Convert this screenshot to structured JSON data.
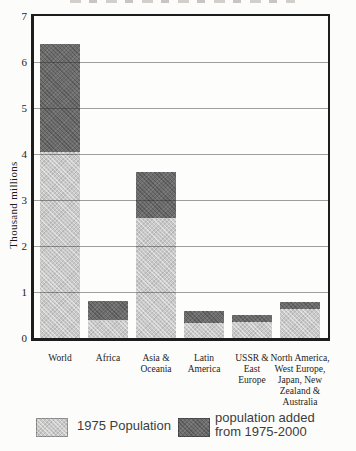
{
  "chart_data": {
    "type": "bar",
    "stacked": true,
    "ylabel": "Thousand millions",
    "ylim": [
      0,
      7
    ],
    "yticks": [
      0,
      1,
      2,
      3,
      4,
      5,
      6,
      7
    ],
    "grid": true,
    "legend_position": "bottom",
    "categories": [
      "World",
      "Africa",
      "Asia &\nOceania",
      "Latin\nAmerica",
      "USSR &\nEast\nEurope",
      "North America,\nWest Europe,\nJapan, New\nZealand &\nAustralia"
    ],
    "series": [
      {
        "name": "1975 Population",
        "color": "#c9c9c9",
        "values": [
          4.05,
          0.4,
          2.6,
          0.32,
          0.35,
          0.64
        ]
      },
      {
        "name": "population added\nfrom 1975-2000",
        "color": "#6d6d6d",
        "values": [
          2.35,
          0.4,
          1.0,
          0.27,
          0.15,
          0.14
        ]
      }
    ],
    "totals_2000": [
      6.4,
      0.8,
      3.6,
      0.59,
      0.5,
      0.78
    ]
  },
  "colors": {
    "background": "#fcfcfb",
    "frame": "#1d1d1d",
    "gridline": "rgba(45,45,45,0.45)",
    "bar_light": "#c9c9c9",
    "bar_dark": "#6d6d6d",
    "text": "#1c1c1c",
    "legend_text": "#3c3c3c"
  }
}
